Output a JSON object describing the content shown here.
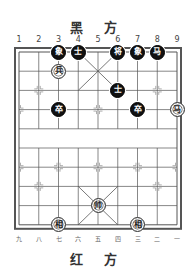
{
  "top_title": "黑 方",
  "bottom_title": "红 方",
  "top_column_labels": [
    "1",
    "2",
    "3",
    "4",
    "5",
    "6",
    "7",
    "8",
    "9"
  ],
  "bottom_column_labels": [
    "九",
    "八",
    "七",
    "六",
    "五",
    "四",
    "三",
    "二",
    "一"
  ],
  "board": {
    "columns": 9,
    "rows": 10,
    "river_between_rows": [
      4,
      5
    ]
  },
  "pieces": [
    {
      "side": "black",
      "label": "象",
      "col": 3,
      "row": 0
    },
    {
      "side": "black",
      "label": "士",
      "col": 4,
      "row": 0
    },
    {
      "side": "black",
      "label": "将",
      "col": 6,
      "row": 0
    },
    {
      "side": "black",
      "label": "象",
      "col": 7,
      "row": 0
    },
    {
      "side": "black",
      "label": "马",
      "col": 8,
      "row": 0
    },
    {
      "side": "red",
      "label": "兵",
      "col": 3,
      "row": 1
    },
    {
      "side": "black",
      "label": "士",
      "col": 6,
      "row": 2
    },
    {
      "side": "black",
      "label": "卒",
      "col": 3,
      "row": 3
    },
    {
      "side": "black",
      "label": "卒",
      "col": 7,
      "row": 3
    },
    {
      "side": "red",
      "label": "马",
      "col": 9,
      "row": 3
    },
    {
      "side": "red",
      "label": "帅",
      "col": 5,
      "row": 8
    },
    {
      "side": "red",
      "label": "相",
      "col": 3,
      "row": 9
    },
    {
      "side": "red",
      "label": "相",
      "col": 7,
      "row": 9
    }
  ],
  "colors": {
    "line": "#555555",
    "black_piece": "#111111",
    "red_piece_fill": "#ffffff"
  }
}
